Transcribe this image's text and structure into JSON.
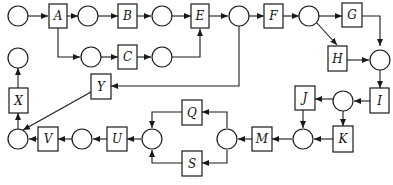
{
  "diagram": {
    "type": "petri-net-flow",
    "transitions": [
      {
        "id": "A",
        "label": "A"
      },
      {
        "id": "B",
        "label": "B"
      },
      {
        "id": "C",
        "label": "C"
      },
      {
        "id": "E",
        "label": "E"
      },
      {
        "id": "F",
        "label": "F"
      },
      {
        "id": "G",
        "label": "G"
      },
      {
        "id": "H",
        "label": "H"
      },
      {
        "id": "I",
        "label": "I"
      },
      {
        "id": "J",
        "label": "J"
      },
      {
        "id": "K",
        "label": "K"
      },
      {
        "id": "M",
        "label": "M"
      },
      {
        "id": "Q",
        "label": "Q"
      },
      {
        "id": "S",
        "label": "S"
      },
      {
        "id": "U",
        "label": "U"
      },
      {
        "id": "V",
        "label": "V"
      },
      {
        "id": "X",
        "label": "X"
      },
      {
        "id": "Y",
        "label": "Y"
      }
    ],
    "edges": [
      "start -> A",
      "A -> p1",
      "p1 -> B",
      "B -> p2",
      "p2 -> E",
      "A -> p3",
      "p3 -> C",
      "C -> p4",
      "p4 -> E",
      "E -> p5",
      "p5 -> F",
      "p5 -> Y",
      "F -> p6",
      "p6 -> G",
      "p6 -> H",
      "G -> p7",
      "H -> p7",
      "p7 -> I",
      "I -> p8",
      "p8 -> J",
      "p8 -> K",
      "J -> p9",
      "K -> p9",
      "p9 -> M",
      "M -> p10",
      "p10 -> Q",
      "p10 -> S",
      "Q -> p11",
      "S -> p11",
      "p11 -> U",
      "U -> p12",
      "p12 -> V",
      "V -> p13",
      "Y -> p13",
      "p13 -> X",
      "X -> end"
    ],
    "caption": "· · ·"
  }
}
